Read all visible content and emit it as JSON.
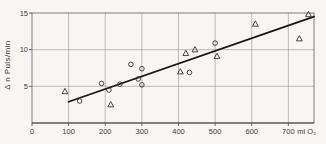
{
  "figure": {
    "background": "#f7f6f3",
    "width": 326,
    "height": 144
  },
  "colors": {
    "grid": "#949494",
    "frame": "#6e6e6e",
    "axis": "#4a4a4a",
    "trend_line": "#161616",
    "marker_stroke": "#333333",
    "text": "#3c3c3c"
  },
  "chart_data": {
    "type": "scatter",
    "title": "",
    "ylabel": "Δ n Puls/min",
    "x_unit_label": "ml O₂",
    "xlim": [
      0,
      770
    ],
    "ylim": [
      0,
      15
    ],
    "x_ticks": [
      0,
      100,
      200,
      300,
      400,
      500,
      600,
      700
    ],
    "y_ticks": [
      5,
      10,
      15
    ],
    "grid": true,
    "legend": "none",
    "series": [
      {
        "name": "circle-points",
        "marker": "circle",
        "points": [
          [
            130,
            3.0
          ],
          [
            190,
            5.4
          ],
          [
            210,
            4.5
          ],
          [
            240,
            5.3
          ],
          [
            270,
            8.0
          ],
          [
            290,
            6.0
          ],
          [
            300,
            7.4
          ],
          [
            300,
            5.2
          ],
          [
            430,
            6.9
          ],
          [
            500,
            10.9
          ]
        ]
      },
      {
        "name": "triangle-points",
        "marker": "triangle",
        "points": [
          [
            90,
            4.3
          ],
          [
            215,
            2.5
          ],
          [
            405,
            7.0
          ],
          [
            420,
            9.5
          ],
          [
            445,
            10.0
          ],
          [
            505,
            9.1
          ],
          [
            610,
            13.5
          ],
          [
            730,
            11.5
          ],
          [
            755,
            14.8
          ]
        ]
      }
    ],
    "trend_line": {
      "x1": 100,
      "y1": 2.9,
      "x2": 770,
      "y2": 14.5
    },
    "plot_area_px": {
      "left": 32,
      "top": 13,
      "right": 314,
      "bottom": 123
    }
  }
}
